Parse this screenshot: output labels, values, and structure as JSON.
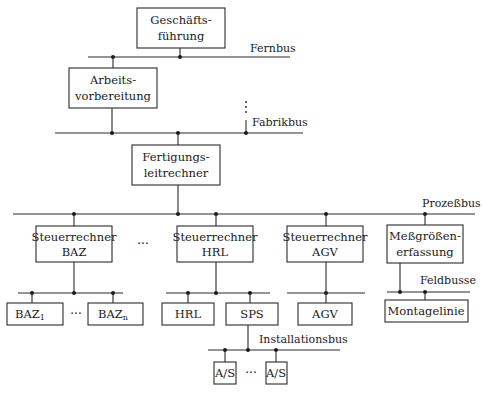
{
  "nodes": {
    "geschaeftsfuehrung": {
      "line1": "Geschäfts-",
      "line2": "führung"
    },
    "arbeitsvorbereitung": {
      "line1": "Arbeits-",
      "line2": "vorbereitung"
    },
    "fertigungsleitrechner": {
      "line1": "Fertigungs-",
      "line2": "leitrechner"
    },
    "steuerrechner_baz": {
      "line1": "Steuerrechner",
      "line2": "BAZ"
    },
    "steuerrechner_hrl": {
      "line1": "Steuerrechner",
      "line2": "HRL"
    },
    "steuerrechner_agv": {
      "line1": "Steuerrechner",
      "line2": "AGV"
    },
    "messgroessenerfassung": {
      "line1": "Meßgrößen-",
      "line2": "erfassung"
    },
    "baz1": {
      "label": "BAZ",
      "sub": "1"
    },
    "bazn": {
      "label": "BAZ",
      "sub": "n"
    },
    "hrl": {
      "label": "HRL"
    },
    "sps": {
      "label": "SPS"
    },
    "agv": {
      "label": "AGV"
    },
    "montagelinie": {
      "label": "Montagelinie"
    },
    "as1": {
      "label": "A/S"
    },
    "as2": {
      "label": "A/S"
    }
  },
  "buses": {
    "fernbus": "Fernbus",
    "fabrikbus": "Fabrikbus",
    "prozessbus": "Prozeßbus",
    "feldbusse": "Feldbusse",
    "installationsbus": "Installationsbus"
  },
  "ellipses": {
    "vertical": "⋮",
    "horizontal": "···"
  }
}
